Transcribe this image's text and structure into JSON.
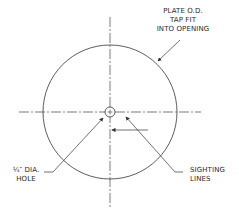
{
  "diagram": {
    "labels": {
      "plate_od": [
        "PLATE O.D.",
        "TAP FIT",
        "INTO OPENING"
      ],
      "hole": [
        "¼″ DIA.",
        "HOLE"
      ],
      "sighting": [
        "SIGHTING",
        "LINES"
      ]
    },
    "colors": {
      "line": "#333333",
      "background": "#ffffff"
    }
  }
}
